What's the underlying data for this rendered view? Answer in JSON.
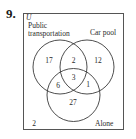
{
  "problem": {
    "number_label": "9."
  },
  "venn": {
    "universe_label": "U",
    "sets": [
      {
        "name": "Public transportation",
        "label_line1": "Public",
        "label_line2": "transportation"
      },
      {
        "name": "Car pool",
        "label": "Car pool"
      },
      {
        "name": "Alone",
        "label": "Alone"
      }
    ],
    "regions": {
      "public_only": "17",
      "public_and_carpool_only": "2",
      "carpool_only": "12",
      "all_three": "3",
      "public_and_alone_only": "6",
      "carpool_and_alone_only": "1",
      "alone_only": "27",
      "outside": "2"
    },
    "colors": {
      "line": "#3a3a3a",
      "box": "#555555",
      "text": "#2a2a2a"
    }
  }
}
